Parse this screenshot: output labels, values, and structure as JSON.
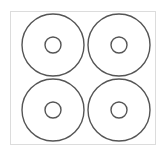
{
  "diagram": {
    "title": "",
    "sheet": {
      "border_color": "#dcdcdc",
      "background": "#ffffff"
    },
    "stroke_color": "#555555",
    "discs": [
      {
        "id": "top-left",
        "cx": 53,
        "cy": 45,
        "outer_r": 31,
        "inner_r": 8
      },
      {
        "id": "top-right",
        "cx": 119,
        "cy": 45,
        "outer_r": 31,
        "inner_r": 8
      },
      {
        "id": "bottom-left",
        "cx": 53,
        "cy": 110,
        "outer_r": 31,
        "inner_r": 8
      },
      {
        "id": "bottom-right",
        "cx": 119,
        "cy": 110,
        "outer_r": 31,
        "inner_r": 8
      }
    ]
  }
}
